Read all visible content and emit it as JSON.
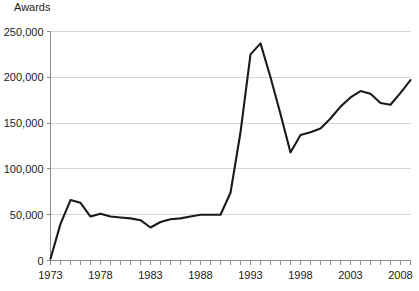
{
  "chart_data": {
    "type": "line",
    "title": "",
    "ylabel": "Awards",
    "xlabel": "",
    "ylim": [
      0,
      250000
    ],
    "xlim": [
      1973,
      2009
    ],
    "grid": true,
    "legend": false,
    "y_ticks": [
      0,
      50000,
      100000,
      150000,
      200000,
      250000
    ],
    "y_tick_labels": [
      "0",
      "50,000",
      "100,000",
      "150,000",
      "200,000",
      "250,000"
    ],
    "x_ticks": [
      1973,
      1978,
      1983,
      1988,
      1993,
      1998,
      2003,
      2008
    ],
    "x_tick_labels": [
      "1973",
      "1978",
      "1983",
      "1988",
      "1993",
      "1998",
      "2003",
      "2008"
    ],
    "x_minor_tick_interval": 1,
    "series": [
      {
        "name": "Awards",
        "color": "#1a1a1a",
        "x": [
          1973,
          1974,
          1975,
          1976,
          1977,
          1978,
          1979,
          1980,
          1981,
          1982,
          1983,
          1984,
          1985,
          1986,
          1987,
          1988,
          1989,
          1990,
          1991,
          1992,
          1993,
          1994,
          1995,
          1996,
          1997,
          1998,
          1999,
          2000,
          2001,
          2002,
          2003,
          2004,
          2005,
          2006,
          2007,
          2008,
          2009
        ],
        "values": [
          2000,
          40000,
          66000,
          63000,
          48000,
          51000,
          48000,
          47000,
          46000,
          44000,
          36000,
          42000,
          45000,
          46000,
          48000,
          50000,
          50000,
          50000,
          74000,
          140000,
          225000,
          237000,
          200000,
          160000,
          118000,
          137000,
          140000,
          144000,
          155000,
          168000,
          178000,
          185000,
          182000,
          172000,
          170000,
          183000,
          197000
        ]
      }
    ]
  }
}
